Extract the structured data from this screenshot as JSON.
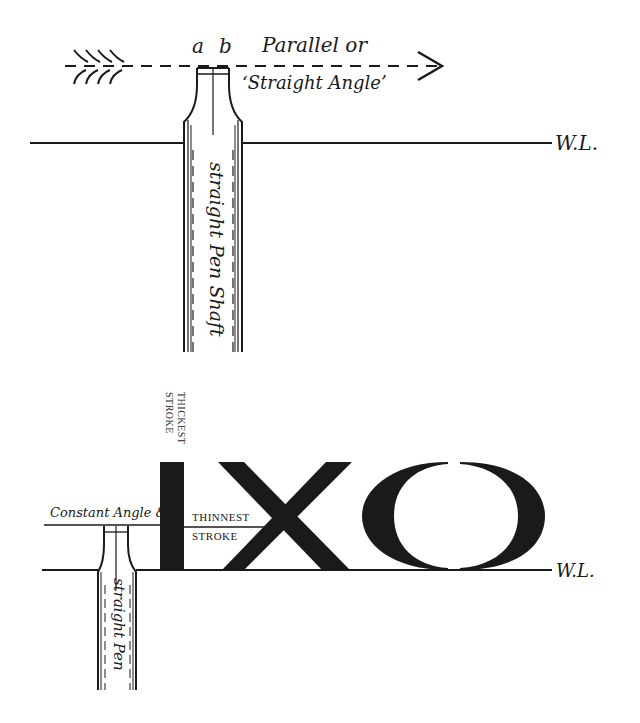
{
  "top_diagram": {
    "label_a": "a",
    "label_b": "b",
    "direction_label_line1": "Parallel or",
    "direction_label_line2": "‘Straight Angle’",
    "shaft_label": "straight Pen Shaft",
    "writing_line_label": "W.L."
  },
  "bottom_diagram": {
    "constant_angle_label": "Constant Angle &",
    "thickest_label_line1": "THICKEST",
    "thickest_label_line2": "STROKE",
    "thinnest_label_line1": "THINNEST",
    "thinnest_label_line2": "STROKE",
    "letters": "IXO",
    "pen_label": "straight Pen",
    "writing_line_label": "W.L."
  },
  "colors": {
    "ink": "#1a1a1a",
    "background": "#ffffff"
  }
}
